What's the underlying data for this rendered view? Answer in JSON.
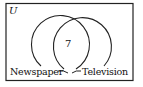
{
  "diagram": {
    "type": "venn",
    "universe_label": "U",
    "sets": [
      {
        "name": "Newspaper"
      },
      {
        "name": "Television"
      }
    ],
    "regions": {
      "intersection": "7"
    },
    "colors": {
      "stroke": "#222222",
      "background": "#ffffff"
    }
  }
}
